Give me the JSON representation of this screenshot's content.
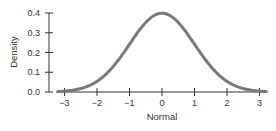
{
  "chart_data": {
    "type": "line",
    "title": "",
    "xlabel": "Normal",
    "ylabel": "Density",
    "xlim": [
      -3.2,
      3.2
    ],
    "ylim": [
      0.0,
      0.4
    ],
    "x_ticks": [
      -3,
      -2,
      -1,
      0,
      1,
      2,
      3
    ],
    "x_tick_labels": [
      "−3",
      "−2",
      "−1",
      "0",
      "1",
      "2",
      "3"
    ],
    "y_ticks": [
      0.0,
      0.1,
      0.2,
      0.3,
      0.4
    ],
    "y_tick_labels": [
      "0.0",
      "0.1",
      "0.2",
      "0.3",
      "0.4"
    ],
    "grid": false,
    "legend": null,
    "series": [
      {
        "name": "Normal density",
        "color": "#7a7a7a",
        "x": [
          -3.2,
          -3.0,
          -2.5,
          -2.0,
          -1.5,
          -1.0,
          -0.5,
          0.0,
          0.5,
          1.0,
          1.5,
          2.0,
          2.5,
          3.0,
          3.2
        ],
        "y": [
          0.0024,
          0.0044,
          0.0175,
          0.054,
          0.1295,
          0.242,
          0.3521,
          0.3989,
          0.3521,
          0.242,
          0.1295,
          0.054,
          0.0175,
          0.0044,
          0.0024
        ]
      }
    ]
  },
  "colors": {
    "curve": "#7a7a7a",
    "axis": "#333333"
  }
}
